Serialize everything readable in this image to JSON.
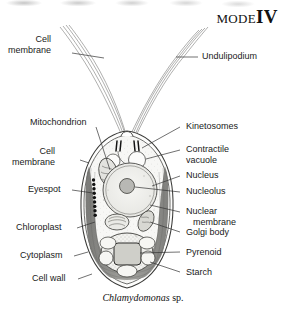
{
  "header": {
    "mode_word": "MODE",
    "mode_number": "IV"
  },
  "caption": {
    "genus": "Chlamydomonas",
    "qualifier": "sp."
  },
  "figure": {
    "organism": "Chlamydomonas sp.",
    "kind": "labelled cell diagram",
    "colors": {
      "ink": "#1a1a1a",
      "leader_line": "#333333",
      "cell_fill": "#f7f7f5",
      "chloroplast": "#8d8d8a",
      "nucleus_fill": "#efefec",
      "background": "#ffffff"
    }
  },
  "labels_left": [
    {
      "id": "cell-membrane-flagellum",
      "line1": "Cell",
      "line2": "membrane",
      "target": "undulipodium sheath"
    },
    {
      "id": "mitochondrion",
      "line1": "Mitochondrion",
      "line2": "",
      "target": "upper mitochondrion"
    },
    {
      "id": "cell-membrane-body",
      "line1": "Cell",
      "line2": "membrane",
      "target": "cell membrane"
    },
    {
      "id": "eyespot",
      "line1": "Eyespot",
      "line2": "",
      "target": "eyespot / stigma"
    },
    {
      "id": "chloroplast",
      "line1": "Chloroplast",
      "line2": "",
      "target": "cup-shaped chloroplast"
    },
    {
      "id": "cytoplasm",
      "line1": "Cytoplasm",
      "line2": "",
      "target": "cytoplasm"
    },
    {
      "id": "cell-wall",
      "line1": "Cell wall",
      "line2": "",
      "target": "cell wall"
    }
  ],
  "labels_right": [
    {
      "id": "undulipodium",
      "line1": "Undulipodium",
      "line2": "",
      "target": "flagellum"
    },
    {
      "id": "kinetosomes",
      "line1": "Kinetosomes",
      "line2": "",
      "target": "basal bodies"
    },
    {
      "id": "contractile-vacuole",
      "line1": "Contractile",
      "line2": "vacuole",
      "target": "contractile vacuoles"
    },
    {
      "id": "nucleus",
      "line1": "Nucleus",
      "line2": "",
      "target": "nucleus"
    },
    {
      "id": "nucleolus",
      "line1": "Nucleolus",
      "line2": "",
      "target": "nucleolus"
    },
    {
      "id": "nuclear-membrane",
      "line1": "Nuclear",
      "line2": "membrane",
      "target": "nuclear envelope"
    },
    {
      "id": "golgi-body",
      "line1": "Golgi body",
      "line2": "",
      "target": "golgi apparatus"
    },
    {
      "id": "pyrenoid",
      "line1": "Pyrenoid",
      "line2": "",
      "target": "pyrenoid"
    },
    {
      "id": "starch",
      "line1": "Starch",
      "line2": "",
      "target": "starch grains"
    }
  ]
}
